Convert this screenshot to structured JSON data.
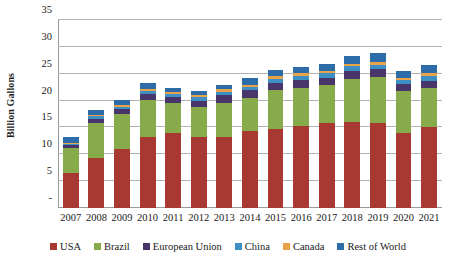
{
  "chart_data": {
    "type": "bar",
    "stacked": true,
    "title": "",
    "xlabel": "",
    "ylabel": "Billion Gallons",
    "ylim": [
      0,
      35
    ],
    "yticks": [
      "-",
      "5",
      "10",
      "15",
      "20",
      "25",
      "30",
      "35"
    ],
    "ytick_values": [
      0,
      5,
      10,
      15,
      20,
      25,
      30,
      35
    ],
    "grid": true,
    "legend_position": "bottom",
    "categories": [
      "2007",
      "2008",
      "2009",
      "2010",
      "2011",
      "2012",
      "2013",
      "2014",
      "2015",
      "2016",
      "2017",
      "2018",
      "2019",
      "2020",
      "2021"
    ],
    "series": [
      {
        "name": "USA",
        "color": "#a83832",
        "values": [
          6.5,
          9.3,
          10.9,
          13.2,
          13.9,
          13.2,
          13.3,
          14.3,
          14.8,
          15.3,
          15.8,
          16.1,
          15.8,
          13.9,
          15.0
        ]
      },
      {
        "name": "Brazil",
        "color": "#87aa4b",
        "values": [
          4.7,
          6.6,
          6.6,
          7.0,
          5.6,
          5.6,
          6.3,
          6.2,
          7.1,
          7.1,
          7.1,
          8.0,
          8.6,
          7.9,
          7.4
        ]
      },
      {
        "name": "European Union",
        "color": "#48366b",
        "values": [
          0.5,
          0.7,
          0.9,
          1.0,
          1.1,
          1.2,
          1.4,
          1.4,
          1.4,
          1.4,
          1.4,
          1.4,
          1.4,
          1.2,
          1.3
        ]
      },
      {
        "name": "China",
        "color": "#3d8fc4",
        "values": [
          0.3,
          0.5,
          0.5,
          0.5,
          0.6,
          0.6,
          0.6,
          0.6,
          0.7,
          0.8,
          0.8,
          0.9,
          0.9,
          0.8,
          0.9
        ]
      },
      {
        "name": "Canada",
        "color": "#e8a24a",
        "values": [
          0.2,
          0.2,
          0.3,
          0.4,
          0.4,
          0.4,
          0.5,
          0.5,
          0.5,
          0.5,
          0.5,
          0.5,
          0.5,
          0.4,
          0.5
        ]
      },
      {
        "name": "Rest of World",
        "color": "#2c6ca8",
        "values": [
          1.0,
          0.9,
          1.0,
          1.1,
          0.7,
          0.7,
          0.9,
          1.2,
          1.2,
          1.2,
          1.2,
          1.4,
          1.6,
          1.4,
          1.5
        ]
      }
    ]
  }
}
